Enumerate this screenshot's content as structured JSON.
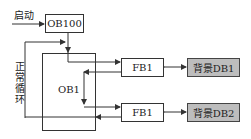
{
  "diagram": {
    "start_label": "启动",
    "cycle_label": "正常循环",
    "blocks": {
      "ob100": "OB100",
      "ob1": "OB1",
      "fb1_top": "FB1",
      "fb1_bottom": "FB1",
      "db1": "背景DB1",
      "db2": "背景DB2"
    },
    "colors": {
      "line": "#333333",
      "db_fill": "#bdbdbd"
    }
  }
}
